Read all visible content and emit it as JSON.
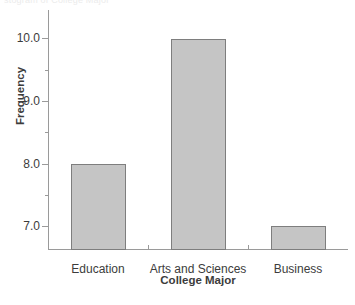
{
  "top_clipped_text": "stogram of College Major",
  "chart_data": {
    "type": "bar",
    "title": "",
    "categories": [
      "Education",
      "Arts and Sciences",
      "Business"
    ],
    "values": [
      8.0,
      9.98,
      7.0
    ],
    "xlabel": "College Major",
    "ylabel": "Frequency",
    "ylim": [
      6.62,
      10.45
    ],
    "ytick_values": [
      7.0,
      8.0,
      9.0,
      10.0
    ],
    "ytick_labels": [
      "7.0",
      "8.0",
      "9.0",
      "10.0"
    ],
    "yminor_tick_values": [
      7.5,
      8.5,
      9.5
    ],
    "grid": false,
    "legend": false,
    "bar_fill_color": "#c5c5c5",
    "bar_edge_color": "#7e7e7e",
    "axis_color": "#9a9a9a",
    "background_color": "#ffffff"
  }
}
